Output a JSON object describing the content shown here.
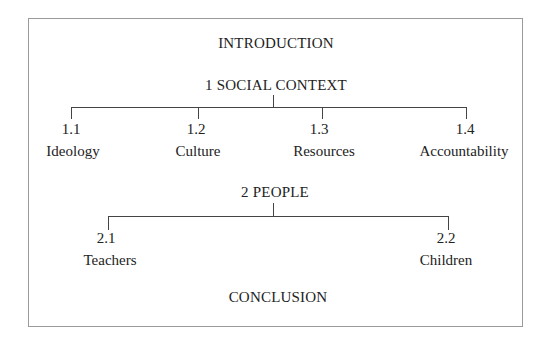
{
  "diagram": {
    "type": "outline-tree",
    "colors": {
      "text": "#222222",
      "lines": "#444444",
      "border": "#9a9a9a",
      "background": "#ffffff"
    },
    "introduction": "INTRODUCTION",
    "conclusion": "CONCLUSION",
    "sections": [
      {
        "title": "1 SOCIAL CONTEXT",
        "children": [
          {
            "number": "1.1",
            "label": "Ideology"
          },
          {
            "number": "1.2",
            "label": "Culture"
          },
          {
            "number": "1.3",
            "label": "Resources"
          },
          {
            "number": "1.4",
            "label": "Accountability"
          }
        ]
      },
      {
        "title": "2 PEOPLE",
        "children": [
          {
            "number": "2.1",
            "label": "Teachers"
          },
          {
            "number": "2.2",
            "label": "Children"
          }
        ]
      }
    ]
  }
}
